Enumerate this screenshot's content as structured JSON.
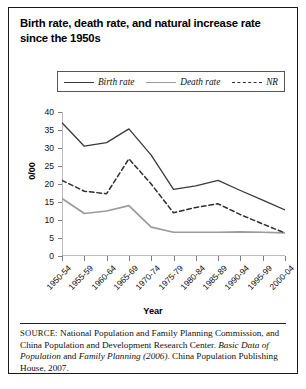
{
  "title": "Birth rate, death rate, and natural increase rate since the 1950s",
  "legend": {
    "birth": "Birth rate",
    "death": "Death rate",
    "nr": "NR"
  },
  "axes": {
    "ylabel": "0/00",
    "xlabel": "Year"
  },
  "source": {
    "prefix": "SOURCE:",
    "text_1": " National Population and Family Planning Commission, and China Population and Development Research Center. ",
    "italic_1": "Basic Data of Population",
    "text_2": " and ",
    "italic_2": "Family Planning (2006)",
    "text_3": ". China Population Publishing House, 2007."
  },
  "colors": {
    "birth": "#3a3a3a",
    "death": "#9a9a9a",
    "nr": "#2e2e2e",
    "axis": "#7d7d7d",
    "frame": "#1a1a1a",
    "text": "#111111"
  },
  "chart_data": {
    "type": "line",
    "title": "Birth rate, death rate, and natural increase rate since the 1950s",
    "xlabel": "Year",
    "ylabel": "0/00",
    "ylim": [
      0,
      40
    ],
    "yticks": [
      0,
      5,
      10,
      15,
      20,
      25,
      30,
      35,
      40
    ],
    "grid": false,
    "legend_position": "top",
    "categories": [
      "1950-54",
      "1955-59",
      "1960-64",
      "1965-69",
      "1970-74",
      "1975-79",
      "1980-84",
      "1985-89",
      "1990-94",
      "1995-99",
      "2000-04"
    ],
    "series": [
      {
        "name": "Birth rate",
        "style": "solid",
        "color": "#3a3a3a",
        "values": [
          37.0,
          30.5,
          31.5,
          35.3,
          28.0,
          18.5,
          19.5,
          21.0,
          18.2,
          15.5,
          12.8
        ]
      },
      {
        "name": "Death rate",
        "style": "solid",
        "color": "#9a9a9a",
        "values": [
          16.0,
          11.8,
          12.5,
          14.0,
          8.0,
          6.6,
          6.6,
          6.6,
          6.7,
          6.6,
          6.4
        ]
      },
      {
        "name": "NR",
        "style": "dashed",
        "color": "#2e2e2e",
        "values": [
          21.0,
          18.0,
          17.3,
          27.0,
          20.0,
          12.0,
          13.5,
          14.5,
          11.5,
          8.9,
          6.4
        ]
      }
    ]
  }
}
